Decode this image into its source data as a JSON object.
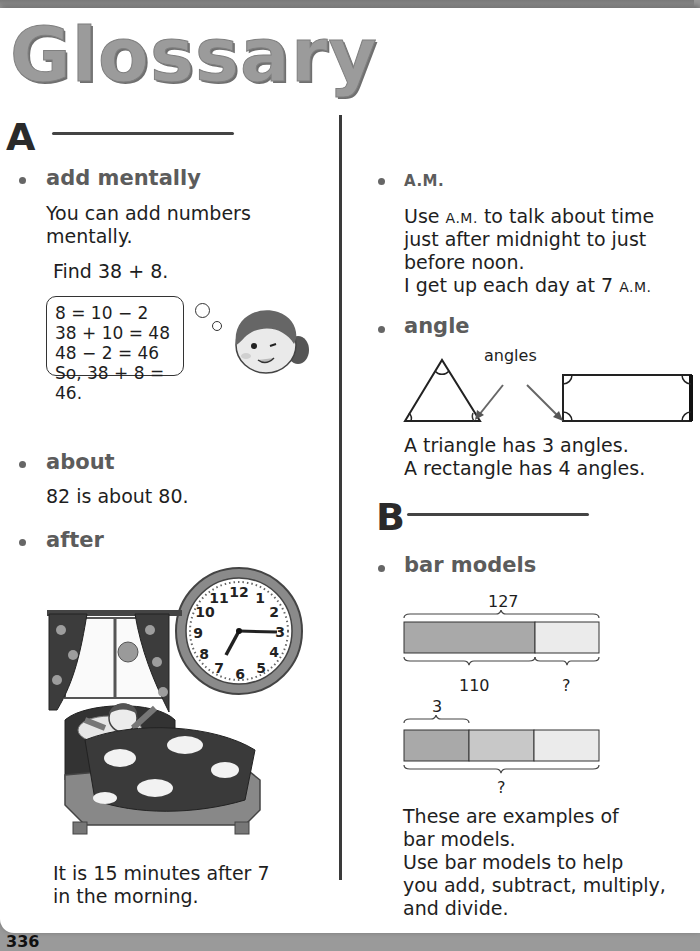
{
  "page": {
    "title": "Glossary",
    "page_number": "336"
  },
  "sections": {
    "A": {
      "letter": "A",
      "entries": {
        "add_mentally": {
          "term": "add mentally",
          "definition_line1": "You can add numbers",
          "definition_line2": "mentally.",
          "example": "Find 38 + 8.",
          "thought_lines": [
            "8 = 10 − 2",
            "38 + 10 = 48",
            "48  − 2 = 46",
            "So, 38 + 8 = 46."
          ]
        },
        "about": {
          "term": "about",
          "definition": "82 is about 80."
        },
        "after": {
          "term": "after",
          "caption_line1": "It is 15 minutes after 7",
          "caption_line2": "in the morning.",
          "clock_numbers": [
            "12",
            "1",
            "2",
            "3",
            "4",
            "5",
            "6",
            "7",
            "8",
            "9",
            "10",
            "11"
          ],
          "clock_time": "7:15"
        },
        "am": {
          "term": "A.M.",
          "line1_prefix": "Use ",
          "line1_sc": "A.M.",
          "line1_suffix": " to talk about time",
          "line2": "just after midnight to just",
          "line3": "before noon.",
          "line4_prefix": "I get up each day at 7 ",
          "line4_sc": "A.M."
        },
        "angle": {
          "term": "angle",
          "label": "angles",
          "line1": "A triangle has 3 angles.",
          "line2": "A rectangle has 4 angles."
        }
      }
    },
    "B": {
      "letter": "B",
      "entries": {
        "bar_models": {
          "term": "bar models",
          "model1": {
            "total": "127",
            "part1": "110",
            "part2": "?"
          },
          "model2": {
            "unit": "3",
            "total": "?"
          },
          "line1": "These are examples of",
          "line2": "bar models.",
          "line3": "Use bar models to help",
          "line4": "you add, subtract, multiply,",
          "line5": "and divide."
        }
      }
    }
  },
  "colors": {
    "title_gray": "#9b9b9b",
    "term_gray": "#5c5c5c",
    "bar_dark": "#a9a9a9",
    "bar_mid": "#c8c8c8",
    "bar_light": "#ebebeb"
  }
}
